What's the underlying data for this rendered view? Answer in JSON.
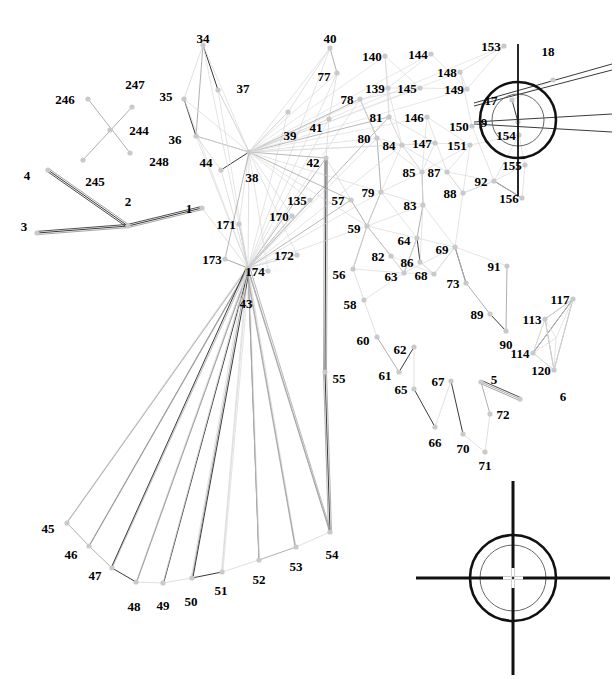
{
  "figure": {
    "kind": "technical-line-diagram",
    "canvas": {
      "width": 616,
      "height": 679
    },
    "colors": {
      "background": "#ffffff",
      "label": "#000000",
      "node": "#c9c9c9",
      "edge_light": "#d8d8d8",
      "edge_mid": "#9a9a9a",
      "edge_dark": "#3a3a3a",
      "crosshair": "#111111"
    }
  },
  "nodes": [
    {
      "id": "1",
      "x": 202,
      "y": 208,
      "lx": 202,
      "ly": 208,
      "anchor": "left"
    },
    {
      "id": "2",
      "x": 128,
      "y": 226,
      "lx": 128,
      "ly": 214,
      "anchor": "above"
    },
    {
      "id": "3",
      "x": 37,
      "y": 233,
      "lx": 37,
      "ly": 226,
      "anchor": "left"
    },
    {
      "id": "4",
      "x": 48,
      "y": 170,
      "lx": 40,
      "ly": 175,
      "anchor": "left"
    },
    {
      "id": "5",
      "x": 481,
      "y": 382,
      "lx": 481,
      "ly": 379,
      "anchor": "right"
    },
    {
      "id": "6",
      "x": 520,
      "y": 399,
      "lx": 550,
      "ly": 396,
      "anchor": "right"
    },
    {
      "id": "9",
      "x": 518,
      "y": 122,
      "lx": 497,
      "ly": 122,
      "anchor": "left"
    },
    {
      "id": "17",
      "x": 512,
      "y": 100,
      "lx": 504,
      "ly": 100,
      "anchor": "left"
    },
    {
      "id": "18",
      "x": 553,
      "y": 80,
      "lx": 548,
      "ly": 64,
      "anchor": "above"
    },
    {
      "id": "34",
      "x": 203,
      "y": 45,
      "lx": 203,
      "ly": 51,
      "anchor": "above"
    },
    {
      "id": "35",
      "x": 184,
      "y": 99,
      "lx": 179,
      "ly": 96,
      "anchor": "left"
    },
    {
      "id": "36",
      "x": 196,
      "y": 136,
      "lx": 188,
      "ly": 139,
      "anchor": "left"
    },
    {
      "id": "37",
      "x": 218,
      "y": 90,
      "lx": 230,
      "ly": 88,
      "anchor": "right"
    },
    {
      "id": "38",
      "x": 249,
      "y": 152,
      "lx": 252,
      "ly": 164,
      "anchor": "below"
    },
    {
      "id": "39",
      "x": 288,
      "y": 112,
      "lx": 290,
      "ly": 122,
      "anchor": "below"
    },
    {
      "id": "40",
      "x": 330,
      "y": 48,
      "lx": 330,
      "ly": 51,
      "anchor": "above"
    },
    {
      "id": "41",
      "x": 329,
      "y": 119,
      "lx": 329,
      "ly": 127,
      "anchor": "left"
    },
    {
      "id": "42",
      "x": 326,
      "y": 158,
      "lx": 326,
      "ly": 162,
      "anchor": "left"
    },
    {
      "id": "43",
      "x": 248,
      "y": 268,
      "lx": 246,
      "ly": 290,
      "anchor": "below"
    },
    {
      "id": "44",
      "x": 221,
      "y": 170,
      "lx": 219,
      "ly": 162,
      "anchor": "left"
    },
    {
      "id": "45",
      "x": 67,
      "y": 523,
      "lx": 61,
      "ly": 528,
      "anchor": "left"
    },
    {
      "id": "46",
      "x": 89,
      "y": 546,
      "lx": 84,
      "ly": 554,
      "anchor": "left"
    },
    {
      "id": "47",
      "x": 112,
      "y": 568,
      "lx": 108,
      "ly": 575,
      "anchor": "left"
    },
    {
      "id": "48",
      "x": 136,
      "y": 582,
      "lx": 134,
      "ly": 593,
      "anchor": "below"
    },
    {
      "id": "49",
      "x": 163,
      "y": 583,
      "lx": 163,
      "ly": 592,
      "anchor": "below"
    },
    {
      "id": "50",
      "x": 192,
      "y": 578,
      "lx": 191,
      "ly": 588,
      "anchor": "below"
    },
    {
      "id": "51",
      "x": 222,
      "y": 572,
      "lx": 221,
      "ly": 577,
      "anchor": "below"
    },
    {
      "id": "52",
      "x": 259,
      "y": 560,
      "lx": 259,
      "ly": 566,
      "anchor": "below"
    },
    {
      "id": "53",
      "x": 296,
      "y": 547,
      "lx": 296,
      "ly": 553,
      "anchor": "below"
    },
    {
      "id": "54",
      "x": 330,
      "y": 532,
      "lx": 332,
      "ly": 541,
      "anchor": "below"
    },
    {
      "id": "55",
      "x": 325,
      "y": 372,
      "lx": 326,
      "ly": 378,
      "anchor": "right"
    },
    {
      "id": "56",
      "x": 353,
      "y": 269,
      "lx": 352,
      "ly": 274,
      "anchor": "left"
    },
    {
      "id": "57",
      "x": 351,
      "y": 200,
      "lx": 351,
      "ly": 200,
      "anchor": "left"
    },
    {
      "id": "58",
      "x": 364,
      "y": 300,
      "lx": 363,
      "ly": 304,
      "anchor": "left"
    },
    {
      "id": "59",
      "x": 367,
      "y": 226,
      "lx": 367,
      "ly": 228,
      "anchor": "left"
    },
    {
      "id": "60",
      "x": 377,
      "y": 337,
      "lx": 376,
      "ly": 340,
      "anchor": "left"
    },
    {
      "id": "61",
      "x": 399,
      "y": 372,
      "lx": 398,
      "ly": 375,
      "anchor": "left"
    },
    {
      "id": "62",
      "x": 414,
      "y": 347,
      "lx": 413,
      "ly": 349,
      "anchor": "left"
    },
    {
      "id": "63",
      "x": 404,
      "y": 273,
      "lx": 404,
      "ly": 276,
      "anchor": "left"
    },
    {
      "id": "64",
      "x": 417,
      "y": 238,
      "lx": 417,
      "ly": 240,
      "anchor": "left"
    },
    {
      "id": "65",
      "x": 414,
      "y": 389,
      "lx": 414,
      "ly": 389,
      "anchor": "left"
    },
    {
      "id": "66",
      "x": 435,
      "y": 427,
      "lx": 435,
      "ly": 429,
      "anchor": "below"
    },
    {
      "id": "67",
      "x": 451,
      "y": 381,
      "lx": 451,
      "ly": 381,
      "anchor": "left"
    },
    {
      "id": "68",
      "x": 434,
      "y": 274,
      "lx": 434,
      "ly": 275,
      "anchor": "left"
    },
    {
      "id": "69",
      "x": 455,
      "y": 247,
      "lx": 455,
      "ly": 249,
      "anchor": "left"
    },
    {
      "id": "70",
      "x": 463,
      "y": 434,
      "lx": 463,
      "ly": 435,
      "anchor": "below"
    },
    {
      "id": "71",
      "x": 485,
      "y": 452,
      "lx": 485,
      "ly": 452,
      "anchor": "below"
    },
    {
      "id": "72",
      "x": 490,
      "y": 414,
      "lx": 490,
      "ly": 414,
      "anchor": "right"
    },
    {
      "id": "73",
      "x": 466,
      "y": 283,
      "lx": 466,
      "ly": 283,
      "anchor": "left"
    },
    {
      "id": "77",
      "x": 337,
      "y": 73,
      "lx": 337,
      "ly": 76,
      "anchor": "left"
    },
    {
      "id": "78",
      "x": 360,
      "y": 99,
      "lx": 360,
      "ly": 99,
      "anchor": "left"
    },
    {
      "id": "79",
      "x": 381,
      "y": 192,
      "lx": 381,
      "ly": 192,
      "anchor": "left"
    },
    {
      "id": "80",
      "x": 377,
      "y": 138,
      "lx": 377,
      "ly": 138,
      "anchor": "left"
    },
    {
      "id": "81",
      "x": 389,
      "y": 117,
      "lx": 389,
      "ly": 117,
      "anchor": "left"
    },
    {
      "id": "82",
      "x": 391,
      "y": 256,
      "lx": 391,
      "ly": 256,
      "anchor": "left"
    },
    {
      "id": "83",
      "x": 423,
      "y": 205,
      "lx": 423,
      "ly": 205,
      "anchor": "left"
    },
    {
      "id": "84",
      "x": 402,
      "y": 145,
      "lx": 402,
      "ly": 145,
      "anchor": "left"
    },
    {
      "id": "85",
      "x": 422,
      "y": 172,
      "lx": 422,
      "ly": 172,
      "anchor": "left"
    },
    {
      "id": "86",
      "x": 420,
      "y": 262,
      "lx": 420,
      "ly": 262,
      "anchor": "left"
    },
    {
      "id": "87",
      "x": 447,
      "y": 172,
      "lx": 447,
      "ly": 172,
      "anchor": "left"
    },
    {
      "id": "88",
      "x": 463,
      "y": 193,
      "lx": 463,
      "ly": 193,
      "anchor": "left"
    },
    {
      "id": "89",
      "x": 490,
      "y": 314,
      "lx": 490,
      "ly": 314,
      "anchor": "left"
    },
    {
      "id": "90",
      "x": 506,
      "y": 331,
      "lx": 506,
      "ly": 331,
      "anchor": "below"
    },
    {
      "id": "91",
      "x": 507,
      "y": 266,
      "lx": 507,
      "ly": 266,
      "anchor": "left"
    },
    {
      "id": "92",
      "x": 494,
      "y": 181,
      "lx": 494,
      "ly": 181,
      "anchor": "left"
    },
    {
      "id": "113",
      "x": 545,
      "y": 319,
      "lx": 545,
      "ly": 319,
      "anchor": "left"
    },
    {
      "id": "114",
      "x": 533,
      "y": 353,
      "lx": 533,
      "ly": 353,
      "anchor": "left"
    },
    {
      "id": "117",
      "x": 573,
      "y": 299,
      "lx": 573,
      "ly": 299,
      "anchor": "left"
    },
    {
      "id": "120",
      "x": 554,
      "y": 370,
      "lx": 554,
      "ly": 370,
      "anchor": "left"
    },
    {
      "id": "135",
      "x": 310,
      "y": 200,
      "lx": 310,
      "ly": 200,
      "anchor": "left"
    },
    {
      "id": "139",
      "x": 388,
      "y": 88,
      "lx": 388,
      "ly": 88,
      "anchor": "left"
    },
    {
      "id": "140",
      "x": 385,
      "y": 56,
      "lx": 385,
      "ly": 56,
      "anchor": "left"
    },
    {
      "id": "144",
      "x": 431,
      "y": 54,
      "lx": 431,
      "ly": 54,
      "anchor": "left"
    },
    {
      "id": "145",
      "x": 420,
      "y": 88,
      "lx": 420,
      "ly": 88,
      "anchor": "left"
    },
    {
      "id": "146",
      "x": 427,
      "y": 117,
      "lx": 427,
      "ly": 117,
      "anchor": "left"
    },
    {
      "id": "147",
      "x": 435,
      "y": 143,
      "lx": 435,
      "ly": 143,
      "anchor": "left"
    },
    {
      "id": "148",
      "x": 460,
      "y": 72,
      "lx": 460,
      "ly": 72,
      "anchor": "left"
    },
    {
      "id": "149",
      "x": 467,
      "y": 89,
      "lx": 467,
      "ly": 89,
      "anchor": "left"
    },
    {
      "id": "150",
      "x": 472,
      "y": 126,
      "lx": 472,
      "ly": 126,
      "anchor": "left"
    },
    {
      "id": "151",
      "x": 470,
      "y": 145,
      "lx": 470,
      "ly": 145,
      "anchor": "left"
    },
    {
      "id": "153",
      "x": 504,
      "y": 46,
      "lx": 504,
      "ly": 46,
      "anchor": "left"
    },
    {
      "id": "154",
      "x": 519,
      "y": 135,
      "lx": 519,
      "ly": 135,
      "anchor": "left"
    },
    {
      "id": "155",
      "x": 525,
      "y": 165,
      "lx": 525,
      "ly": 165,
      "anchor": "left"
    },
    {
      "id": "156",
      "x": 522,
      "y": 198,
      "lx": 522,
      "ly": 198,
      "anchor": "left"
    },
    {
      "id": "170",
      "x": 292,
      "y": 216,
      "lx": 292,
      "ly": 216,
      "anchor": "left"
    },
    {
      "id": "171",
      "x": 239,
      "y": 224,
      "lx": 239,
      "ly": 224,
      "anchor": "left"
    },
    {
      "id": "172",
      "x": 297,
      "y": 255,
      "lx": 297,
      "ly": 255,
      "anchor": "left"
    },
    {
      "id": "173",
      "x": 225,
      "y": 259,
      "lx": 225,
      "ly": 259,
      "anchor": "left"
    },
    {
      "id": "174",
      "x": 268,
      "y": 271,
      "lx": 268,
      "ly": 271,
      "anchor": "left"
    },
    {
      "id": "244",
      "x": 110,
      "y": 130,
      "lx": 126,
      "ly": 130,
      "anchor": "right"
    },
    {
      "id": "245",
      "x": 83,
      "y": 160,
      "lx": 95,
      "ly": 168,
      "anchor": "below"
    },
    {
      "id": "246",
      "x": 88,
      "y": 99,
      "lx": 78,
      "ly": 99,
      "anchor": "left"
    },
    {
      "id": "247",
      "x": 132,
      "y": 107,
      "lx": 135,
      "ly": 97,
      "anchor": "above"
    },
    {
      "id": "248",
      "x": 130,
      "y": 153,
      "lx": 146,
      "ly": 161,
      "anchor": "right"
    }
  ],
  "crosshairs": [
    {
      "name": "registration-mark-top-right",
      "cx": 518,
      "cy": 120,
      "outer_r": 38,
      "inner_r": 26,
      "arm": 76,
      "vertical_only_arm": true
    },
    {
      "name": "registration-mark-bottom-right",
      "cx": 513,
      "cy": 578,
      "outer_r": 43,
      "inner_r": 33,
      "arm": 97,
      "vertical_only_arm": false
    }
  ],
  "edges": [
    [
      "3",
      "2"
    ],
    [
      "2",
      "1"
    ],
    [
      "2",
      "4"
    ],
    [
      "246",
      "248"
    ],
    [
      "245",
      "247"
    ],
    [
      "34",
      "37"
    ],
    [
      "34",
      "36"
    ],
    [
      "34",
      "35"
    ],
    [
      "35",
      "36"
    ],
    [
      "36",
      "38"
    ],
    [
      "37",
      "38"
    ],
    [
      "38",
      "39"
    ],
    [
      "39",
      "40"
    ],
    [
      "40",
      "77"
    ],
    [
      "77",
      "41"
    ],
    [
      "41",
      "42"
    ],
    [
      "38",
      "43"
    ],
    [
      "44",
      "43"
    ],
    [
      "44",
      "38"
    ],
    [
      "36",
      "44"
    ],
    [
      "1",
      "43"
    ],
    [
      "171",
      "43"
    ],
    [
      "173",
      "43"
    ],
    [
      "174",
      "43"
    ],
    [
      "170",
      "43"
    ],
    [
      "172",
      "43"
    ],
    [
      "135",
      "43"
    ],
    [
      "43",
      "45"
    ],
    [
      "43",
      "46"
    ],
    [
      "43",
      "47"
    ],
    [
      "43",
      "48"
    ],
    [
      "43",
      "49"
    ],
    [
      "43",
      "50"
    ],
    [
      "43",
      "51"
    ],
    [
      "43",
      "52"
    ],
    [
      "43",
      "53"
    ],
    [
      "43",
      "54"
    ],
    [
      "45",
      "46"
    ],
    [
      "46",
      "47"
    ],
    [
      "47",
      "48"
    ],
    [
      "48",
      "49"
    ],
    [
      "49",
      "50"
    ],
    [
      "50",
      "51"
    ],
    [
      "51",
      "52"
    ],
    [
      "52",
      "53"
    ],
    [
      "53",
      "54"
    ],
    [
      "54",
      "55"
    ],
    [
      "55",
      "42"
    ],
    [
      "57",
      "59"
    ],
    [
      "59",
      "56"
    ],
    [
      "56",
      "58"
    ],
    [
      "58",
      "60"
    ],
    [
      "60",
      "61"
    ],
    [
      "61",
      "62"
    ],
    [
      "62",
      "65"
    ],
    [
      "65",
      "66"
    ],
    [
      "66",
      "67"
    ],
    [
      "67",
      "70"
    ],
    [
      "70",
      "71"
    ],
    [
      "71",
      "72"
    ],
    [
      "72",
      "5"
    ],
    [
      "5",
      "6"
    ],
    [
      "42",
      "57"
    ],
    [
      "78",
      "80"
    ],
    [
      "80",
      "79"
    ],
    [
      "79",
      "59"
    ],
    [
      "81",
      "84"
    ],
    [
      "84",
      "85"
    ],
    [
      "85",
      "83"
    ],
    [
      "83",
      "64"
    ],
    [
      "64",
      "86"
    ],
    [
      "86",
      "68"
    ],
    [
      "68",
      "69"
    ],
    [
      "69",
      "73"
    ],
    [
      "73",
      "89"
    ],
    [
      "89",
      "90"
    ],
    [
      "90",
      "91"
    ],
    [
      "82",
      "63"
    ],
    [
      "63",
      "64"
    ],
    [
      "59",
      "82"
    ],
    [
      "87",
      "88"
    ],
    [
      "88",
      "92"
    ],
    [
      "92",
      "156"
    ],
    [
      "113",
      "117"
    ],
    [
      "113",
      "114"
    ],
    [
      "114",
      "120"
    ],
    [
      "117",
      "120"
    ],
    [
      "113",
      "120"
    ],
    [
      "114",
      "117"
    ],
    [
      "17",
      "18"
    ],
    [
      "9",
      "17"
    ]
  ]
}
